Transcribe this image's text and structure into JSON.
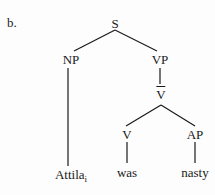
{
  "example": {
    "label": "b."
  },
  "tree": {
    "root": "S",
    "nodes": {
      "s": "S",
      "np": "NP",
      "vp": "VP",
      "vbar": "V",
      "v": "V",
      "ap": "AP"
    },
    "leaves": {
      "attila": "Attila",
      "attila_index": "i",
      "was": "was",
      "nasty": "nasty"
    },
    "structure": [
      {
        "parent": "S",
        "children": [
          "NP",
          "VP"
        ]
      },
      {
        "parent": "NP",
        "children": [
          "Attila_i"
        ]
      },
      {
        "parent": "VP",
        "children": [
          "V-bar"
        ]
      },
      {
        "parent": "V-bar",
        "children": [
          "V",
          "AP"
        ]
      },
      {
        "parent": "V",
        "children": [
          "was"
        ]
      },
      {
        "parent": "AP",
        "children": [
          "nasty"
        ]
      }
    ],
    "line_color": "#1a1a1a"
  }
}
